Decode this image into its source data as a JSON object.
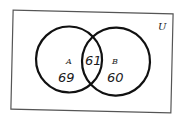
{
  "diagram": {
    "type": "venn",
    "universe_label": "U",
    "sets": [
      {
        "label": "A",
        "only_count": "69"
      },
      {
        "label": "B",
        "only_count": "60"
      }
    ],
    "intersection_count": "61",
    "colors": {
      "stroke": "#111111",
      "border": "#555555",
      "background": "#ffffff"
    }
  }
}
